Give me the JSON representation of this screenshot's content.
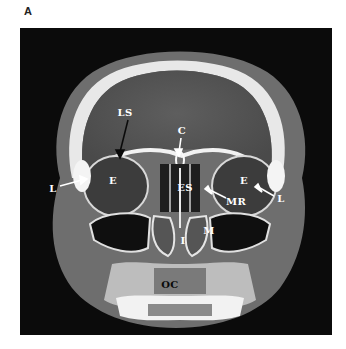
{
  "figure": {
    "panel_letter": "A",
    "image_type": "coronal CT scan of skull at level of orbits and maxillary sinuses",
    "labels": [
      {
        "id": "LS",
        "text": "LS",
        "x": 105,
        "y": 84,
        "color": "white"
      },
      {
        "id": "C",
        "text": "C",
        "x": 162,
        "y": 102,
        "color": "white"
      },
      {
        "id": "L-left",
        "text": "L",
        "x": 33,
        "y": 160,
        "color": "white"
      },
      {
        "id": "E-left",
        "text": "E",
        "x": 93,
        "y": 152,
        "color": "white"
      },
      {
        "id": "ES",
        "text": "ES",
        "x": 165,
        "y": 159,
        "color": "white"
      },
      {
        "id": "E-right",
        "text": "E",
        "x": 224,
        "y": 152,
        "color": "white"
      },
      {
        "id": "MR",
        "text": "MR",
        "x": 216,
        "y": 173,
        "color": "white"
      },
      {
        "id": "L-right",
        "text": "L",
        "x": 261,
        "y": 170,
        "color": "white"
      },
      {
        "id": "M",
        "text": "M",
        "x": 189,
        "y": 202,
        "color": "white"
      },
      {
        "id": "I",
        "text": "I",
        "x": 163,
        "y": 212,
        "color": "white"
      },
      {
        "id": "OC",
        "text": "OC",
        "x": 150,
        "y": 256,
        "color": "black"
      }
    ]
  }
}
